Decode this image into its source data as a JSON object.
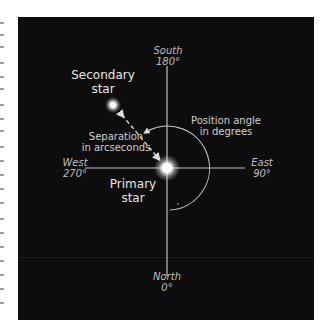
{
  "diagram": {
    "directions": {
      "south": {
        "name": "South",
        "angle": "180°"
      },
      "north": {
        "name": "North",
        "angle": "0°"
      },
      "east": {
        "name": "East",
        "angle": "90°"
      },
      "west": {
        "name": "West",
        "angle": "270°"
      }
    },
    "labels": {
      "secondary_line1": "Secondary",
      "secondary_line2": "star",
      "primary_line1": "Primary",
      "primary_line2": "star",
      "separation_line1": "Separation",
      "separation_line2": "in arcseconds",
      "position_line1": "Position angle",
      "position_line2": "in degrees"
    },
    "colors": {
      "background": "#0d0d0d",
      "axis": "#bfbfbf",
      "text": "#cfcfcf",
      "star": "#ffffff"
    }
  }
}
